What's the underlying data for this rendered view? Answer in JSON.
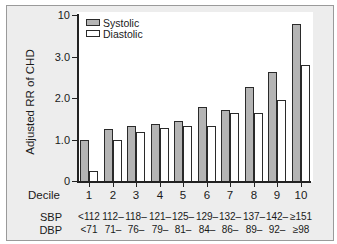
{
  "chart_data": {
    "type": "bar",
    "title": "",
    "xlabel": "Decile",
    "ylabel": "Adjusted RR of CHD",
    "y_axis_broken": true,
    "yticks": [
      "0",
      "1.0",
      "2.0",
      "3.0",
      "10"
    ],
    "ylim": [
      0,
      10
    ],
    "legend": [
      "Systolic",
      "Diastolic"
    ],
    "legend_position": "top-left",
    "categories": [
      "1",
      "2",
      "3",
      "4",
      "5",
      "6",
      "7",
      "8",
      "9",
      "10"
    ],
    "series": [
      {
        "name": "Systolic",
        "color": "#b4b4b4",
        "values": [
          1.0,
          1.25,
          1.32,
          1.37,
          1.45,
          1.78,
          1.7,
          2.27,
          2.63,
          8.5
        ]
      },
      {
        "name": "Diastolic",
        "color": "#ffffff",
        "values": [
          0.25,
          1.0,
          1.18,
          1.27,
          1.32,
          1.32,
          1.65,
          1.65,
          1.95,
          2.8
        ]
      }
    ],
    "sbp_ranges": [
      "<112",
      "112–",
      "118–",
      "121–",
      "125–",
      "129–",
      "132–",
      "137–",
      "142–",
      "≥151"
    ],
    "dbp_ranges": [
      "<71",
      "71–",
      "76–",
      "79–",
      "81–",
      "84–",
      "86–",
      "89–",
      "92–",
      "≥98"
    ]
  },
  "labels": {
    "decile": "Decile",
    "sbp": "SBP",
    "dbp": "DBP"
  }
}
